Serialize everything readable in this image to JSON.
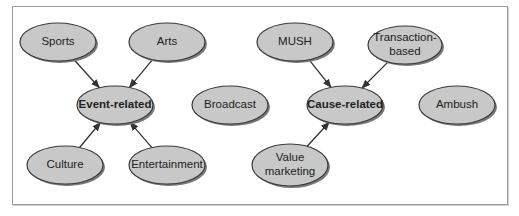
{
  "diagram": {
    "type": "concept-map",
    "colors": {
      "node_fill": "#c8c8c8",
      "node_stroke": "#3a3a3a",
      "edge": "#333333",
      "frame": "#9a9a9a"
    },
    "nodes": [
      {
        "id": "sports",
        "label": "Sports",
        "bold": false,
        "cx": 58,
        "cy": 42,
        "rx": 38,
        "ry": 19
      },
      {
        "id": "arts",
        "label": "Arts",
        "bold": false,
        "cx": 167,
        "cy": 42,
        "rx": 38,
        "ry": 19
      },
      {
        "id": "event",
        "label": "Event-related",
        "bold": true,
        "cx": 115,
        "cy": 105,
        "rx": 38,
        "ry": 19
      },
      {
        "id": "broadcast",
        "label": "Broadcast",
        "bold": false,
        "cx": 230,
        "cy": 105,
        "rx": 38,
        "ry": 19
      },
      {
        "id": "culture",
        "label": "Culture",
        "bold": false,
        "cx": 65,
        "cy": 165,
        "rx": 38,
        "ry": 19
      },
      {
        "id": "entertainment",
        "label": "Entertainment",
        "bold": false,
        "cx": 167,
        "cy": 165,
        "rx": 38,
        "ry": 19
      },
      {
        "id": "mush",
        "label": "MUSH",
        "bold": false,
        "cx": 295,
        "cy": 42,
        "rx": 38,
        "ry": 19
      },
      {
        "id": "transaction",
        "label": "Transaction-\nbased",
        "label_lines": [
          "Transaction-",
          "based"
        ],
        "bold": false,
        "cx": 405,
        "cy": 45,
        "rx": 37,
        "ry": 19
      },
      {
        "id": "cause",
        "label": "Cause-related",
        "bold": true,
        "cx": 345,
        "cy": 105,
        "rx": 38,
        "ry": 19
      },
      {
        "id": "ambush",
        "label": "Ambush",
        "bold": false,
        "cx": 457,
        "cy": 105,
        "rx": 38,
        "ry": 19
      },
      {
        "id": "value",
        "label": "Value\nmarketing",
        "label_lines": [
          "Value",
          "marketing"
        ],
        "bold": false,
        "cx": 290,
        "cy": 165,
        "rx": 38,
        "ry": 21
      }
    ],
    "edges": [
      {
        "from": "sports",
        "to": "event"
      },
      {
        "from": "arts",
        "to": "event"
      },
      {
        "from": "culture",
        "to": "event"
      },
      {
        "from": "entertainment",
        "to": "event"
      },
      {
        "from": "mush",
        "to": "cause"
      },
      {
        "from": "transaction",
        "to": "cause"
      },
      {
        "from": "value",
        "to": "cause"
      }
    ]
  }
}
